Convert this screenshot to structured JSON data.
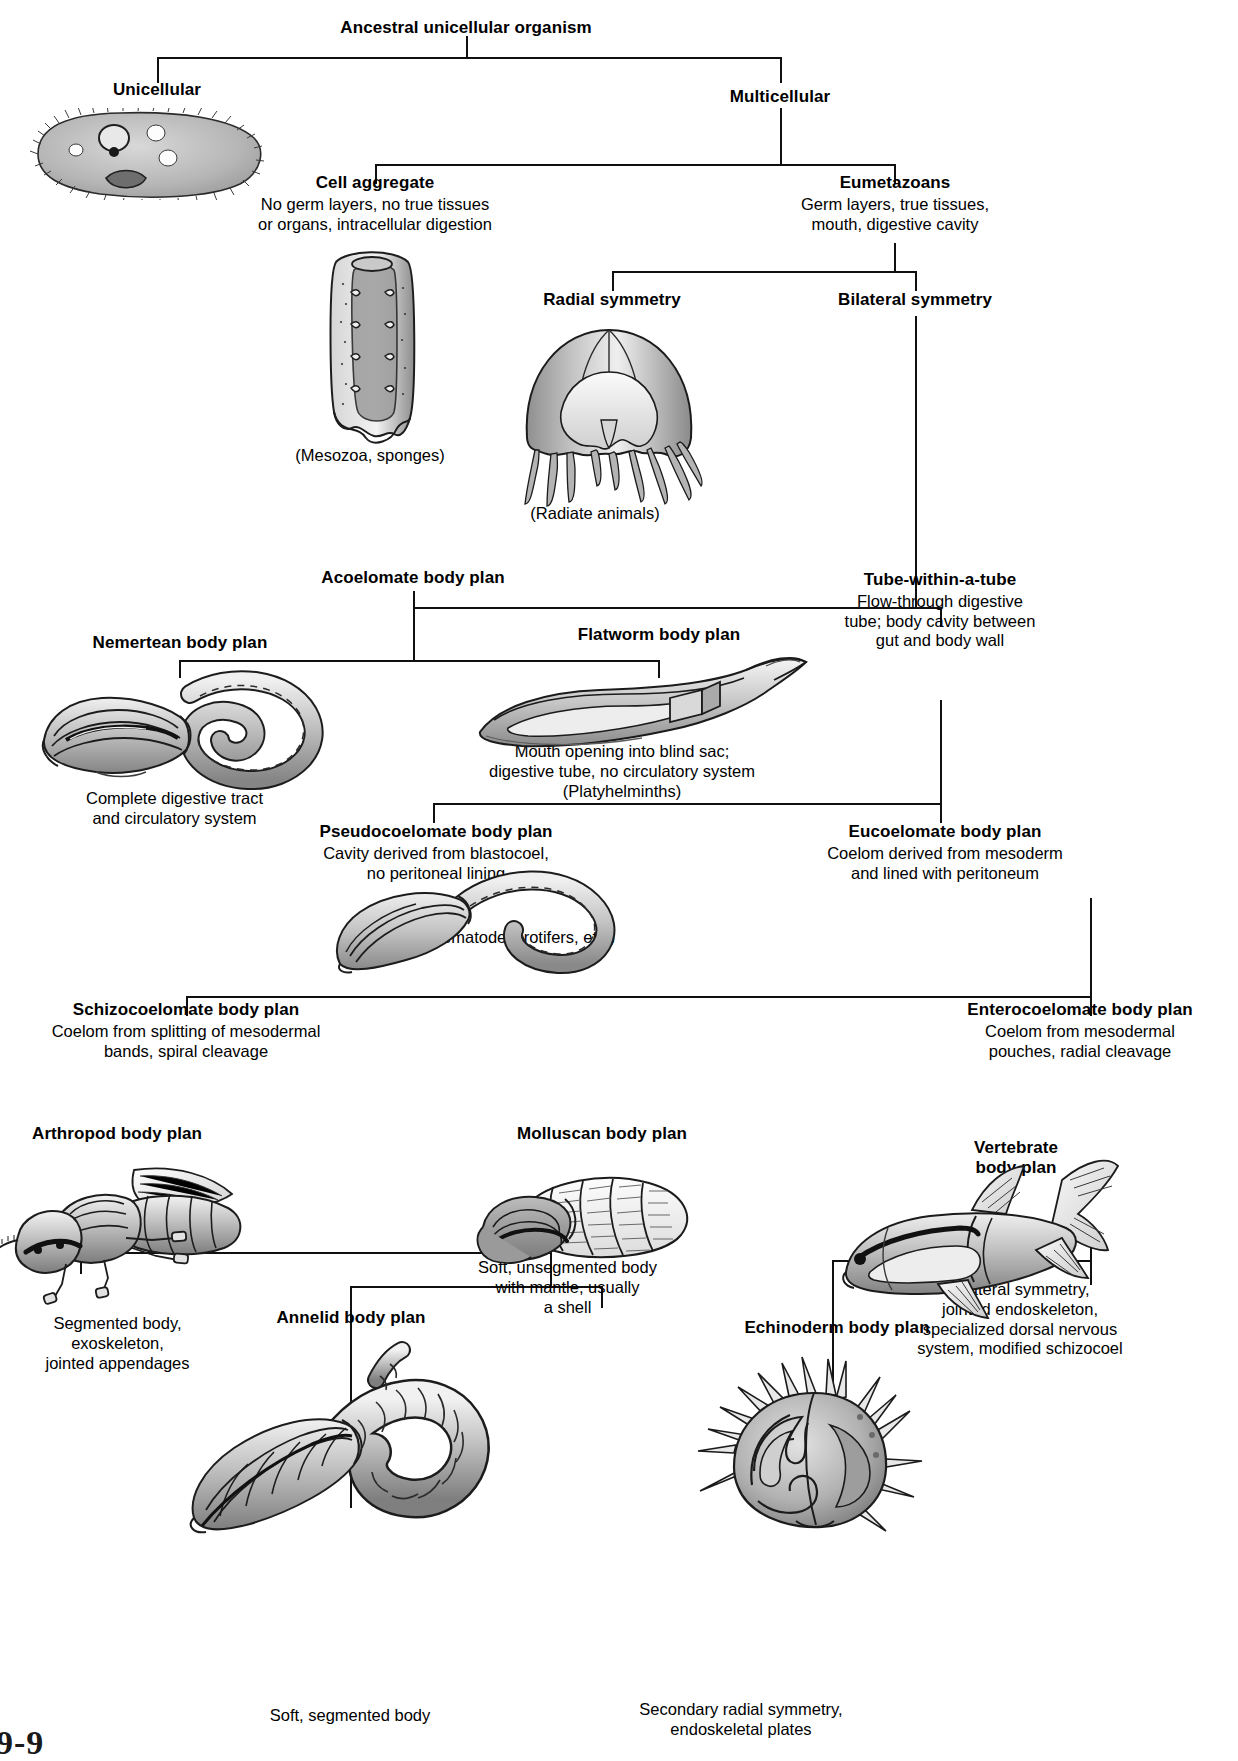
{
  "figure": {
    "label": "9-9",
    "type": "cladogram / body-plan tree"
  },
  "nodes": {
    "ancestral": {
      "title": "Ancestral unicellular organism",
      "desc": ""
    },
    "unicellular": {
      "title": "Unicellular",
      "desc": ""
    },
    "multicellular": {
      "title": "Multicellular",
      "desc": ""
    },
    "cell_aggregate": {
      "title": "Cell aggregate",
      "desc": "No germ layers, no true tissues\nor organs, intracellular digestion"
    },
    "eumetazoans": {
      "title": "Eumetazoans",
      "desc": "Germ layers, true tissues,\nmouth, digestive cavity"
    },
    "radial": {
      "title": "Radial symmetry",
      "desc": ""
    },
    "bilateral": {
      "title": "Bilateral symmetry",
      "desc": ""
    },
    "acoelomate": {
      "title": "Acoelomate body plan",
      "desc": ""
    },
    "tube_within_tube": {
      "title": "Tube-within-a-tube",
      "desc": "Flow-through digestive\ntube; body cavity between\ngut and body wall"
    },
    "nemertean": {
      "title": "Nemertean body plan",
      "desc": ""
    },
    "flatworm": {
      "title": "Flatworm body plan",
      "desc": ""
    },
    "pseudocoelomate": {
      "title": "Pseudocoelomate body plan",
      "desc": "Cavity derived from blastocoel,\nno peritoneal lining"
    },
    "eucoelomate": {
      "title": "Eucoelomate body plan",
      "desc": "Coelom derived from mesoderm\nand lined with peritoneum"
    },
    "schizocoelomate": {
      "title": "Schizocoelomate body plan",
      "desc": "Coelom from splitting of mesodermal\nbands, spiral cleavage"
    },
    "enterocoelomate": {
      "title": "Enterocoelomate body plan",
      "desc": "Coelom from mesodermal\npouches, radial cleavage"
    },
    "arthropod": {
      "title": "Arthropod body plan",
      "desc": ""
    },
    "annelid": {
      "title": "Annelid body plan",
      "desc": ""
    },
    "molluscan": {
      "title": "Molluscan body plan",
      "desc": ""
    },
    "echinoderm": {
      "title": "Echinoderm body plan",
      "desc": ""
    },
    "vertebrate": {
      "title": "Vertebrate\nbody plan",
      "desc": ""
    }
  },
  "captions": {
    "mesozoa": "(Mesozoa, sponges)",
    "radiate": "(Radiate animals)",
    "nemertean": "Complete digestive tract\nand circulatory system",
    "flatworm": "Mouth opening into blind sac;\ndigestive tube, no circulatory system\n(Platyhelminths)",
    "nematodes": "(Nematodes, rotifers, etc.)",
    "arthropod": "Segmented body,\nexoskeleton,\njointed appendages",
    "annelid": "Soft, segmented body",
    "molluscan": "Soft, unsegmented body\nwith mantle, usually\na shell",
    "echinoderm": "Secondary radial symmetry,\nendoskeletal plates",
    "vertebrate": "Bilateral symmetry,\njointed endoskeleton,\nspecialized dorsal nervous\nsystem, modified schizocoel"
  },
  "illustrations": {
    "paramecium": "ciliate-protozoan-illustration",
    "sponge": "sponge-cutaway-illustration",
    "jellyfish": "medusa-cnidarian-illustration",
    "ribbonworm": "nemertean-worm-illustration",
    "flatworm": "flatworm-cutaway-illustration",
    "nematode": "roundworm-illustration",
    "insect": "beetle-arthropod-illustration",
    "earthworm": "annelid-earthworm-illustration",
    "mollusc": "chiton-mollusc-illustration",
    "urchin": "sea-urchin-echinoderm-illustration",
    "fish": "fish-vertebrate-illustration"
  },
  "colors": {
    "line": "#101010",
    "text": "#000000",
    "background": "#ffffff",
    "art_fill_light": "#e9e9e9",
    "art_fill_mid": "#bdbdbd",
    "art_fill_dark": "#8f8f8f",
    "art_stroke": "#1a1a1a"
  }
}
